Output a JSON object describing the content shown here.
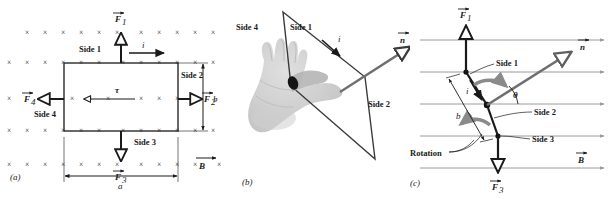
{
  "figure": {
    "colors": {
      "ink": "#1a1a1a",
      "field_mark": "#a8a8a8",
      "field_line": "#9a9a9a",
      "normal_vector": "#6f6f6f",
      "rotation_arrow": "#8a8a8a",
      "hand": "#c9c9c9",
      "loop_stroke": "#2a2a2a"
    }
  },
  "panels": [
    {
      "id": "a",
      "label": "(a)",
      "description": "Top view of rectangular current loop in uniform magnetic field into the page",
      "field_symbol": "×",
      "field_symbol_name": "field-into-page",
      "field_rows": 5,
      "field_cols": 13,
      "labels": {
        "side1": "Side 1",
        "side2": "Side 2",
        "side3": "Side 3",
        "side4": "Side 4",
        "current": "i",
        "torque": "τ",
        "force1": "F",
        "force1_sub": "1",
        "force2": "F",
        "force2_sub": "2",
        "force3": "F",
        "force3_sub": "3",
        "force4": "F",
        "force4_sub": "4",
        "field": "B",
        "dim_width": "a",
        "dim_height": "b"
      }
    },
    {
      "id": "b",
      "label": "(b)",
      "description": "Right-hand rule applied to the loop plane giving the normal vector n",
      "labels": {
        "side1": "Side 1",
        "side2": "Side 2",
        "side4": "Side 4",
        "current": "i",
        "normal": "n"
      }
    },
    {
      "id": "c",
      "label": "(c)",
      "description": "Side view: loop tilted at angle theta to the field, forces produce rotation",
      "labels": {
        "side1": "Side 1",
        "side2": "Side 2",
        "side3": "Side 3",
        "current": "i",
        "normal": "n",
        "field": "B",
        "angle": "θ",
        "rotation": "Rotation",
        "dim_height": "b",
        "force1": "F",
        "force1_sub": "1",
        "force3": "F",
        "force3_sub": "3"
      },
      "field_lines": 5
    }
  ]
}
